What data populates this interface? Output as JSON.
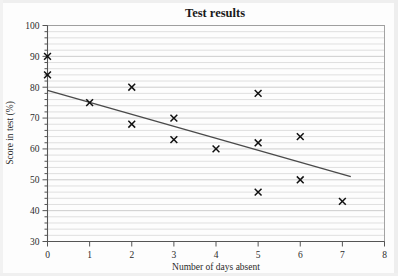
{
  "chart_data": {
    "type": "scatter",
    "title": "Test results",
    "xlabel": "Number of days absent",
    "ylabel": "Score in test (%)",
    "xlim": [
      0,
      8
    ],
    "ylim": [
      30,
      100
    ],
    "x_ticks": [
      0,
      1,
      2,
      3,
      4,
      5,
      6,
      7,
      8
    ],
    "y_ticks": [
      30,
      40,
      50,
      60,
      70,
      80,
      90,
      100
    ],
    "grid": true,
    "grid_step_y": 2,
    "legend": null,
    "marker": "x",
    "marker_color": "#111111",
    "points": [
      {
        "x": 0,
        "y": 90
      },
      {
        "x": 0,
        "y": 84
      },
      {
        "x": 1,
        "y": 75
      },
      {
        "x": 2,
        "y": 80
      },
      {
        "x": 2,
        "y": 68
      },
      {
        "x": 3,
        "y": 70
      },
      {
        "x": 3,
        "y": 63
      },
      {
        "x": 4,
        "y": 60
      },
      {
        "x": 5,
        "y": 78
      },
      {
        "x": 5,
        "y": 62
      },
      {
        "x": 5,
        "y": 46
      },
      {
        "x": 6,
        "y": 64
      },
      {
        "x": 6,
        "y": 50
      },
      {
        "x": 7,
        "y": 43
      }
    ],
    "trend_line": {
      "name": "line of best fit",
      "color": "#4a4a4a",
      "x_start": 0,
      "y_start": 79,
      "x_end": 7.2,
      "y_end": 51
    }
  }
}
